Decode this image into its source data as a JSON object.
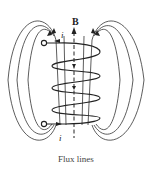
{
  "figure": {
    "type": "solenoid magnetic field diagram",
    "field_label": "B",
    "current_label_top": "i",
    "current_label_bottom": "i",
    "caption": "Flux lines",
    "coil_turns": 4,
    "colors": {
      "line": "#333333",
      "background": "#ffffff"
    }
  }
}
